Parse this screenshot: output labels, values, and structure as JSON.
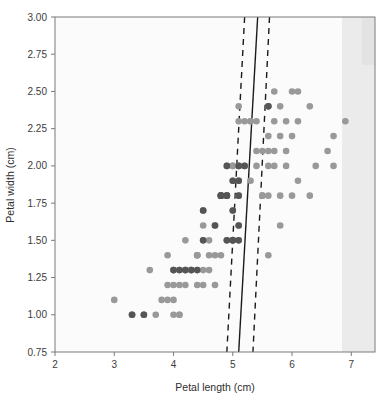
{
  "chart_data": {
    "type": "scatter",
    "title": "",
    "xlabel": "Petal length (cm)",
    "ylabel": "Petal width (cm)",
    "xlim": [
      2,
      7.4
    ],
    "ylim": [
      0.75,
      3.0
    ],
    "xticks": [
      "2",
      "3",
      "4",
      "5",
      "6",
      "7"
    ],
    "xtick_values": [
      2,
      3,
      4,
      5,
      6,
      7
    ],
    "yticks": [
      "0.75",
      "1.00",
      "1.25",
      "1.50",
      "1.75",
      "2.00",
      "2.25",
      "2.50",
      "2.75",
      "3.00"
    ],
    "ytick_values": [
      0.75,
      1.0,
      1.25,
      1.5,
      1.75,
      2.0,
      2.25,
      2.5,
      2.75,
      3.0
    ],
    "grid": false,
    "legend": "none",
    "marker_colors": {
      "light": "#999999",
      "dark": "#555555"
    },
    "series": [
      {
        "name": "versicolor",
        "color": "#999999",
        "points": [
          [
            3.0,
            1.1
          ],
          [
            3.3,
            1.0
          ],
          [
            3.5,
            1.0
          ],
          [
            3.5,
            1.0
          ],
          [
            3.7,
            1.0
          ],
          [
            3.9,
            1.2
          ],
          [
            3.9,
            1.4
          ],
          [
            3.8,
            1.1
          ],
          [
            4.0,
            1.0
          ],
          [
            4.1,
            1.0
          ],
          [
            4.0,
            1.3
          ],
          [
            4.1,
            1.3
          ],
          [
            4.2,
            1.3
          ],
          [
            4.3,
            1.3
          ],
          [
            4.4,
            1.3
          ],
          [
            4.5,
            1.3
          ],
          [
            4.0,
            1.2
          ],
          [
            4.1,
            1.2
          ],
          [
            4.4,
            1.2
          ],
          [
            4.5,
            1.2
          ],
          [
            3.9,
            1.1
          ],
          [
            4.0,
            1.1
          ],
          [
            4.5,
            1.5
          ],
          [
            4.2,
            1.5
          ],
          [
            4.4,
            1.4
          ],
          [
            4.6,
            1.4
          ],
          [
            4.7,
            1.4
          ],
          [
            4.7,
            1.2
          ],
          [
            4.8,
            1.4
          ],
          [
            4.9,
            1.5
          ],
          [
            4.5,
            1.6
          ],
          [
            4.7,
            1.6
          ],
          [
            4.4,
            1.4
          ],
          [
            4.6,
            1.5
          ],
          [
            4.9,
            1.8
          ],
          [
            5.0,
            1.7
          ],
          [
            4.8,
            1.8
          ],
          [
            5.1,
            1.6
          ],
          [
            4.5,
            1.7
          ],
          [
            4.2,
            1.3
          ],
          [
            4.6,
            1.3
          ],
          [
            4.8,
            1.8
          ],
          [
            4.0,
            1.3
          ],
          [
            3.3,
            1.0
          ],
          [
            4.2,
            1.2
          ],
          [
            4.3,
            1.3
          ],
          [
            4.4,
            1.4
          ],
          [
            5.0,
            1.5
          ],
          [
            3.6,
            1.3
          ],
          [
            4.1,
            1.0
          ]
        ]
      },
      {
        "name": "virginica",
        "color": "#999999",
        "points": [
          [
            6.0,
            2.5
          ],
          [
            5.1,
            1.9
          ],
          [
            5.9,
            2.1
          ],
          [
            5.6,
            1.8
          ],
          [
            5.8,
            2.2
          ],
          [
            6.6,
            2.1
          ],
          [
            4.5,
            1.7
          ],
          [
            6.3,
            1.8
          ],
          [
            5.8,
            1.8
          ],
          [
            6.1,
            2.5
          ],
          [
            5.1,
            2.0
          ],
          [
            5.3,
            1.9
          ],
          [
            5.5,
            2.1
          ],
          [
            5.0,
            2.0
          ],
          [
            5.1,
            2.4
          ],
          [
            5.3,
            2.3
          ],
          [
            5.5,
            1.8
          ],
          [
            6.7,
            2.2
          ],
          [
            6.9,
            2.3
          ],
          [
            5.0,
            1.5
          ],
          [
            5.7,
            2.3
          ],
          [
            4.9,
            2.0
          ],
          [
            6.7,
            2.0
          ],
          [
            4.9,
            1.8
          ],
          [
            5.7,
            2.1
          ],
          [
            6.0,
            1.8
          ],
          [
            4.8,
            1.8
          ],
          [
            4.9,
            1.8
          ],
          [
            5.6,
            2.1
          ],
          [
            5.8,
            1.6
          ],
          [
            6.1,
            1.9
          ],
          [
            6.4,
            2.0
          ],
          [
            5.6,
            2.2
          ],
          [
            5.1,
            1.5
          ],
          [
            5.6,
            1.4
          ],
          [
            6.1,
            2.3
          ],
          [
            5.6,
            2.4
          ],
          [
            5.5,
            1.8
          ],
          [
            4.8,
            1.8
          ],
          [
            5.4,
            2.1
          ],
          [
            5.6,
            2.4
          ],
          [
            5.1,
            2.3
          ],
          [
            5.1,
            1.9
          ],
          [
            5.9,
            2.3
          ],
          [
            5.7,
            2.5
          ],
          [
            5.2,
            2.3
          ],
          [
            5.0,
            1.9
          ],
          [
            5.2,
            2.0
          ],
          [
            5.4,
            2.3
          ],
          [
            5.1,
            1.8
          ],
          [
            5.9,
            2.0
          ],
          [
            5.6,
            2.0
          ],
          [
            5.3,
            2.3
          ],
          [
            5.8,
            2.4
          ],
          [
            6.0,
            2.2
          ],
          [
            5.7,
            2.0
          ],
          [
            6.3,
            2.4
          ],
          [
            5.4,
            2.0
          ],
          [
            5.1,
            2.0
          ],
          [
            5.0,
            2.0
          ]
        ]
      },
      {
        "name": "support-vectors",
        "color": "#555555",
        "points": [
          [
            5.1,
            1.6
          ],
          [
            4.8,
            1.8
          ],
          [
            5.0,
            1.7
          ],
          [
            4.9,
            1.5
          ],
          [
            4.5,
            1.7
          ],
          [
            5.1,
            1.5
          ],
          [
            4.9,
            1.8
          ],
          [
            4.8,
            1.8
          ],
          [
            5.0,
            1.5
          ],
          [
            5.1,
            1.9
          ],
          [
            4.9,
            2.0
          ],
          [
            5.6,
            2.4
          ],
          [
            4.5,
            1.5
          ],
          [
            4.0,
            1.3
          ],
          [
            4.1,
            1.3
          ],
          [
            4.2,
            1.3
          ],
          [
            4.3,
            1.3
          ],
          [
            3.3,
            1.0
          ],
          [
            3.5,
            1.0
          ],
          [
            5.0,
            1.9
          ],
          [
            4.7,
            1.6
          ],
          [
            4.4,
            1.3
          ],
          [
            5.1,
            1.8
          ],
          [
            4.9,
            1.8
          ],
          [
            5.0,
            1.5
          ],
          [
            5.1,
            2.0
          ],
          [
            4.8,
            1.8
          ],
          [
            5.2,
            2.0
          ]
        ]
      }
    ],
    "decision_boundary": {
      "style": "solid",
      "x_at_ymax": 5.42,
      "x_at_ymin": 5.1,
      "ymax": 3.0,
      "ymin": 0.75
    },
    "margins": [
      {
        "style": "dashed",
        "x_at_ymax": 5.2,
        "x_at_ymin": 4.9,
        "ymax": 3.0,
        "ymin": 0.75
      },
      {
        "style": "dashed",
        "x_at_ymax": 5.62,
        "x_at_ymin": 5.34,
        "ymax": 3.0,
        "ymin": 0.75
      }
    ]
  }
}
